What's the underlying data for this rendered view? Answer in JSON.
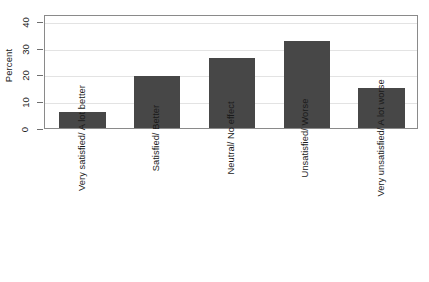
{
  "chart_data": {
    "type": "bar",
    "title": "",
    "xlabel": "",
    "ylabel": "Percent",
    "ylim": [
      0,
      43
    ],
    "yticks": [
      0,
      10,
      20,
      30,
      40
    ],
    "ytick_labels": [
      "0",
      "10",
      "20",
      "30",
      "40"
    ],
    "grid": true,
    "legend": null,
    "bar_color": "#474747",
    "categories": [
      "Very satisfied/ A lot better",
      "Satisfied/ Better",
      "Neutral/ No effect",
      "Unsatisfied/ Worse",
      "Very unsatisfied/ A lot worse"
    ],
    "values": [
      6,
      19.5,
      26.5,
      33,
      15
    ]
  },
  "axis": {
    "y_title": "Percent"
  },
  "colors": {
    "bar": "#474747",
    "gridline": "#e3e3e3",
    "frame": "#8a8a8a",
    "background": "#ffffff",
    "text": "#1a1a1a"
  }
}
